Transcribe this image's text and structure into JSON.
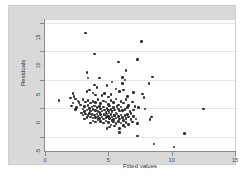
{
  "chart_data": {
    "type": "scatter",
    "title": "",
    "xlabel": "Fitted values",
    "ylabel": "Residuals",
    "xlim": [
      0,
      15
    ],
    "ylim": [
      -7.5,
      15.5
    ],
    "xticks": [
      0,
      5,
      10,
      15
    ],
    "yticks": [
      -5,
      0,
      5,
      10,
      15
    ],
    "xticklabels": [
      "0",
      "5",
      "10",
      "15"
    ],
    "yticklabels": [
      "-5",
      "0",
      "5",
      "10",
      "15"
    ],
    "grid": "horizontal",
    "legend": "none",
    "marker_color": "#2e2e2e",
    "plot_background": "#ffffff",
    "graph_background": "#d9d9d9",
    "points": [
      [
        3.2,
        13.2
      ],
      [
        3.9,
        9.5
      ],
      [
        7.6,
        11.7
      ],
      [
        5.8,
        8.1
      ],
      [
        7.3,
        8.6
      ],
      [
        3.3,
        6.3
      ],
      [
        6.4,
        6.6
      ],
      [
        3.4,
        5.3
      ],
      [
        4.3,
        5.3
      ],
      [
        6.1,
        5.4
      ],
      [
        6.3,
        5.0
      ],
      [
        8.5,
        5.5
      ],
      [
        8.2,
        4.3
      ],
      [
        3.9,
        4.1
      ],
      [
        4.1,
        3.6
      ],
      [
        5.6,
        3.4
      ],
      [
        6.2,
        3.2
      ],
      [
        5.9,
        2.9
      ],
      [
        2.2,
        2.6
      ],
      [
        2.3,
        2.1
      ],
      [
        3.8,
        2.7
      ],
      [
        4.0,
        2.3
      ],
      [
        4.5,
        2.2
      ],
      [
        4.7,
        2.6
      ],
      [
        5.0,
        2.0
      ],
      [
        5.2,
        2.4
      ],
      [
        7.7,
        2.5
      ],
      [
        1.1,
        1.4
      ],
      [
        2.0,
        1.8
      ],
      [
        2.4,
        1.6
      ],
      [
        2.6,
        1.3
      ],
      [
        3.0,
        1.5
      ],
      [
        3.2,
        1.1
      ],
      [
        3.4,
        1.4
      ],
      [
        3.6,
        0.9
      ],
      [
        3.8,
        1.2
      ],
      [
        4.0,
        1.0
      ],
      [
        4.2,
        1.5
      ],
      [
        4.4,
        0.8
      ],
      [
        4.6,
        1.3
      ],
      [
        4.8,
        1.1
      ],
      [
        5.0,
        0.7
      ],
      [
        5.2,
        1.4
      ],
      [
        5.4,
        1.0
      ],
      [
        5.6,
        1.6
      ],
      [
        5.8,
        0.6
      ],
      [
        6.0,
        1.2
      ],
      [
        6.2,
        0.9
      ],
      [
        6.4,
        1.5
      ],
      [
        6.6,
        0.5
      ],
      [
        6.9,
        1.1
      ],
      [
        7.1,
        0.3
      ],
      [
        2.1,
        0.4
      ],
      [
        2.5,
        0.1
      ],
      [
        2.8,
        0.6
      ],
      [
        3.0,
        -0.1
      ],
      [
        3.1,
        0.3
      ],
      [
        3.3,
        -0.3
      ],
      [
        3.4,
        0.5
      ],
      [
        3.5,
        0.0
      ],
      [
        3.6,
        -0.5
      ],
      [
        3.7,
        0.2
      ],
      [
        3.8,
        -0.2
      ],
      [
        3.9,
        0.4
      ],
      [
        4.0,
        -0.4
      ],
      [
        4.1,
        0.1
      ],
      [
        4.2,
        -0.6
      ],
      [
        4.3,
        0.3
      ],
      [
        4.4,
        -0.1
      ],
      [
        4.5,
        -0.5
      ],
      [
        4.6,
        0.2
      ],
      [
        4.7,
        -0.3
      ],
      [
        4.8,
        -0.7
      ],
      [
        4.9,
        0.0
      ],
      [
        5.0,
        -0.4
      ],
      [
        5.1,
        0.4
      ],
      [
        5.2,
        -0.2
      ],
      [
        5.3,
        -0.6
      ],
      [
        5.4,
        0.1
      ],
      [
        5.5,
        -0.3
      ],
      [
        5.6,
        -0.8
      ],
      [
        5.7,
        0.3
      ],
      [
        5.8,
        -0.1
      ],
      [
        5.9,
        -0.5
      ],
      [
        6.0,
        0.2
      ],
      [
        6.1,
        -0.4
      ],
      [
        6.3,
        -0.2
      ],
      [
        6.5,
        0.1
      ],
      [
        6.7,
        -0.6
      ],
      [
        7.0,
        -0.3
      ],
      [
        7.4,
        0.1
      ],
      [
        12.5,
        -0.1
      ],
      [
        3.2,
        -1.0
      ],
      [
        3.4,
        -1.3
      ],
      [
        3.5,
        -0.9
      ],
      [
        3.6,
        -1.5
      ],
      [
        3.7,
        -1.1
      ],
      [
        3.8,
        -1.7
      ],
      [
        3.9,
        -1.2
      ],
      [
        4.0,
        -1.6
      ],
      [
        4.1,
        -1.0
      ],
      [
        4.2,
        -1.4
      ],
      [
        4.3,
        -1.8
      ],
      [
        4.4,
        -1.1
      ],
      [
        4.5,
        -1.5
      ],
      [
        4.6,
        -1.9
      ],
      [
        4.7,
        -1.2
      ],
      [
        4.8,
        -1.6
      ],
      [
        4.9,
        -1.0
      ],
      [
        5.0,
        -1.4
      ],
      [
        5.1,
        -1.8
      ],
      [
        5.2,
        -1.1
      ],
      [
        5.3,
        -1.5
      ],
      [
        5.4,
        -2.0
      ],
      [
        5.5,
        -1.3
      ],
      [
        5.6,
        -1.7
      ],
      [
        5.7,
        -1.0
      ],
      [
        5.8,
        -1.4
      ],
      [
        5.9,
        -1.9
      ],
      [
        6.0,
        -1.2
      ],
      [
        6.1,
        -1.6
      ],
      [
        6.2,
        -2.1
      ],
      [
        6.3,
        -1.3
      ],
      [
        6.4,
        -1.8
      ],
      [
        6.6,
        -1.5
      ],
      [
        6.8,
        -2.0
      ],
      [
        7.0,
        -1.4
      ],
      [
        7.2,
        -1.9
      ],
      [
        2.9,
        -0.8
      ],
      [
        3.0,
        -1.2
      ],
      [
        3.1,
        -0.6
      ],
      [
        4.4,
        -2.3
      ],
      [
        4.6,
        -2.6
      ],
      [
        4.8,
        -2.2
      ],
      [
        5.0,
        -2.5
      ],
      [
        5.2,
        -2.9
      ],
      [
        5.4,
        -2.4
      ],
      [
        5.6,
        -2.7
      ],
      [
        5.8,
        -2.3
      ],
      [
        6.0,
        -2.6
      ],
      [
        6.2,
        -3.0
      ],
      [
        6.4,
        -2.5
      ],
      [
        6.6,
        -2.8
      ],
      [
        6.9,
        -2.4
      ],
      [
        7.3,
        -2.7
      ],
      [
        4.2,
        -2.0
      ],
      [
        4.0,
        -2.4
      ],
      [
        3.8,
        -2.2
      ],
      [
        3.6,
        -2.6
      ],
      [
        5.1,
        -3.3
      ],
      [
        5.5,
        -3.1
      ],
      [
        5.9,
        -3.5
      ],
      [
        6.3,
        -3.3
      ],
      [
        4.9,
        -3.6
      ],
      [
        8.4,
        -1.5
      ],
      [
        8.3,
        -2.0
      ],
      [
        7.9,
        -0.1
      ],
      [
        5.9,
        -4.3
      ],
      [
        7.3,
        -4.9
      ],
      [
        11.0,
        -4.4
      ],
      [
        8.6,
        -6.3
      ],
      [
        10.2,
        -6.8
      ],
      [
        2.2,
        0.9
      ],
      [
        2.4,
        -0.2
      ],
      [
        2.7,
        1.0
      ],
      [
        3.3,
        2.9
      ],
      [
        3.5,
        3.2
      ],
      [
        4.9,
        4.0
      ],
      [
        5.3,
        4.6
      ],
      [
        6.1,
        4.3
      ],
      [
        6.5,
        2.1
      ],
      [
        7.0,
        2.8
      ],
      [
        7.8,
        1.9
      ],
      [
        3.1,
        -1.9
      ],
      [
        3.3,
        -1.6
      ],
      [
        5.3,
        -2.1
      ],
      [
        6.8,
        -0.9
      ],
      [
        6.5,
        -1.1
      ],
      [
        4.35,
        -0.75
      ],
      [
        4.65,
        -1.05
      ],
      [
        5.05,
        -0.85
      ],
      [
        5.45,
        -1.25
      ],
      [
        4.95,
        -1.45
      ]
    ]
  },
  "caption": {
    "text": ""
  }
}
